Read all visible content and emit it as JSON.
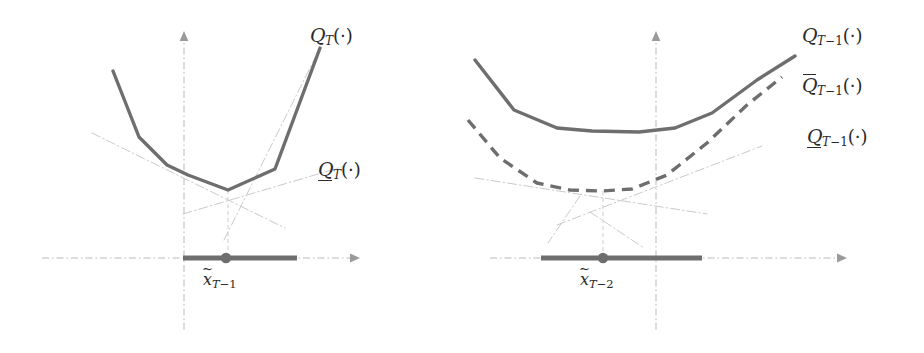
{
  "figure": {
    "type": "diagram",
    "background_color": "#ffffff",
    "curve_color": "#6e6e6e",
    "cut_color": "#cacaca",
    "axis_color": "#b9b9b9",
    "text_color": "#2a2a2a"
  },
  "panels": [
    {
      "id": "left",
      "name": "stage-T-panel",
      "axes": {
        "origin_x": 184,
        "axis_y": 258,
        "x_axis_from": 42,
        "x_axis_to": 360,
        "y_axis_top": 32
      },
      "labels": [
        {
          "name": "q-upper-label",
          "symbol": "Q",
          "decoration": "none",
          "subscript": "T",
          "argument": "(·)",
          "text": "Q_T(·)",
          "x": 310,
          "y": 26
        },
        {
          "name": "q-lower-label",
          "symbol": "Q",
          "decoration": "underline",
          "subscript": "T",
          "argument": "(·)",
          "text": "Q̲_T(·)",
          "x": 318,
          "y": 160
        }
      ],
      "x_tick": {
        "name": "x-tilde-T-1",
        "variable": "x",
        "decoration": "tilde",
        "subscript": "T-1",
        "text": "x̃_(T-1)",
        "x": 203,
        "y": 268
      },
      "feasible_bar": {
        "x_start": 183,
        "x_end": 297,
        "y": 258
      },
      "solution_point": {
        "x": 226,
        "y": 258
      },
      "curve_main": {
        "name": "Q_T",
        "style": "solid",
        "points": [
          [
            113,
            71
          ],
          [
            139,
            137
          ],
          [
            167,
            165
          ],
          [
            188,
            175
          ],
          [
            228,
            190
          ],
          [
            275,
            169
          ],
          [
            320,
            48
          ]
        ]
      },
      "cut_planes": [
        {
          "name": "cut-1-descending",
          "points": [
            [
              92,
              133
            ],
            [
              285,
              228
            ]
          ]
        },
        {
          "name": "cut-2-ascending",
          "points": [
            [
              183,
              214
            ],
            [
              345,
              166
            ]
          ]
        },
        {
          "name": "cut-3-steep",
          "points": [
            [
              224,
              240
            ],
            [
              318,
              52
            ]
          ]
        }
      ],
      "drop_line": {
        "x": 228,
        "y_top": 190,
        "y_bottom": 258
      }
    },
    {
      "id": "right",
      "name": "stage-T-minus-1-panel",
      "axes": {
        "origin_x": 194,
        "axis_y": 258,
        "x_axis_from": 28,
        "x_axis_to": 385,
        "y_axis_top": 32
      },
      "labels": [
        {
          "name": "q-upper-label",
          "symbol": "Q",
          "decoration": "none",
          "subscript": "T-1",
          "argument": "(·)",
          "text": "Q_(T-1)(·)",
          "x": 340,
          "y": 26
        },
        {
          "name": "q-bar-label",
          "symbol": "Q",
          "decoration": "overline",
          "subscript": "T-1",
          "argument": "(·)",
          "text": "Q̄_(T-1)(·)",
          "x": 340,
          "y": 76
        },
        {
          "name": "q-lower-label",
          "symbol": "Q",
          "decoration": "underline",
          "subscript": "T-1",
          "argument": "(·)",
          "text": "Q̲_(T-1)(·)",
          "x": 345,
          "y": 127
        }
      ],
      "x_tick": {
        "name": "x-tilde-T-2",
        "variable": "x",
        "decoration": "tilde",
        "subscript": "T-2",
        "text": "x̃_(T-2)",
        "x": 120,
        "y": 268
      },
      "feasible_bar": {
        "x_start": 79,
        "x_end": 240,
        "y": 258
      },
      "solution_point": {
        "x": 141,
        "y": 258
      },
      "curve_main": {
        "name": "Q_{T-1}",
        "style": "solid",
        "points": [
          [
            13,
            60
          ],
          [
            52,
            110
          ],
          [
            95,
            128
          ],
          [
            130,
            131
          ],
          [
            177,
            132
          ],
          [
            213,
            128
          ],
          [
            250,
            113
          ],
          [
            295,
            80
          ],
          [
            333,
            56
          ]
        ]
      },
      "curve_dashed": {
        "name": "Qbar_{T-1}",
        "style": "dashed",
        "points": [
          [
            6,
            120
          ],
          [
            38,
            158
          ],
          [
            75,
            183
          ],
          [
            108,
            190
          ],
          [
            140,
            191
          ],
          [
            170,
            189
          ],
          [
            205,
            175
          ],
          [
            245,
            143
          ],
          [
            285,
            105
          ],
          [
            320,
            77
          ]
        ]
      },
      "cut_planes": [
        {
          "name": "cut-1-descending",
          "points": [
            [
              13,
              178
            ],
            [
              245,
              214
            ]
          ]
        },
        {
          "name": "cut-2-ascending",
          "points": [
            [
              95,
              225
            ],
            [
              300,
              146
            ]
          ]
        },
        {
          "name": "cut-3-steep",
          "points": [
            [
              128,
              215
            ],
            [
              182,
              246
            ]
          ]
        }
      ],
      "drop_line": {
        "x": 141,
        "y_top": 191,
        "y_bottom": 258
      }
    }
  ]
}
